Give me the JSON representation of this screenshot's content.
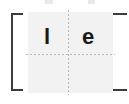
{
  "canvas": {
    "width": 129,
    "height": 104,
    "background_color": "#ffffff"
  },
  "panel": {
    "background_color": "#f2f2f2",
    "label": "content-panel"
  },
  "guides": {
    "color": "#b9b9b9",
    "style": "dotted",
    "vertical_label": "vertical-center-guide",
    "horizontal_label": "horizontal-center-guide"
  },
  "glyphs": [
    {
      "id": "glyph-l",
      "text": "l",
      "color": "#1a1a1a",
      "quadrant": "top-left"
    },
    {
      "id": "glyph-e",
      "text": "e",
      "color": "#1a1a1a",
      "quadrant": "top-right"
    }
  ],
  "brackets": {
    "color": "#3c3c3c",
    "left": "[",
    "right": "]"
  },
  "top_remnants": {
    "color": "#e9e9e9",
    "description": "clipped glyph remnants"
  }
}
